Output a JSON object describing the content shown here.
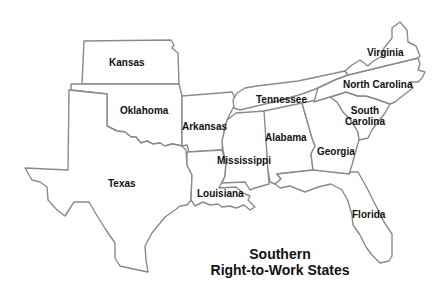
{
  "map": {
    "title_line1": "Southern",
    "title_line2": "Right-to-Work States",
    "states": [
      {
        "id": "kansas",
        "label": "Kansas"
      },
      {
        "id": "oklahoma",
        "label": "Oklahoma"
      },
      {
        "id": "texas",
        "label": "Texas"
      },
      {
        "id": "arkansas",
        "label": "Arkansas"
      },
      {
        "id": "louisiana",
        "label": "Louisiana"
      },
      {
        "id": "mississippi",
        "label": "Mississippi"
      },
      {
        "id": "tennessee",
        "label": "Tennessee"
      },
      {
        "id": "alabama",
        "label": "Alabama"
      },
      {
        "id": "georgia",
        "label": "Georgia"
      },
      {
        "id": "florida",
        "label": "Florida"
      },
      {
        "id": "south-carolina",
        "label_line1": "South",
        "label_line2": "Carolina"
      },
      {
        "id": "north-carolina",
        "label": "North Carolina"
      },
      {
        "id": "virginia",
        "label": "Virginia"
      }
    ],
    "colors": {
      "border": "#8a8a8a",
      "fill": "#ffffff",
      "text": "#111111"
    }
  }
}
